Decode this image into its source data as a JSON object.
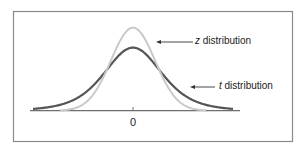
{
  "figure": {
    "frame_color": "#8a8a8a",
    "axis_color": "#6e6e6e",
    "x_tick_label": "0",
    "labels": {
      "z": {
        "var": "z",
        "text": " distribution"
      },
      "t": {
        "var": "t",
        "text": " distribution"
      }
    }
  },
  "chart_data": {
    "type": "line",
    "title": "",
    "xlabel": "",
    "ylabel": "",
    "x_ticks": [
      "0"
    ],
    "grid": false,
    "series": [
      {
        "name": "z distribution",
        "color": "#c9c9c9",
        "shape": "normal",
        "relative_peak": 1.0,
        "relative_spread": 1.0
      },
      {
        "name": "t distribution",
        "color": "#555555",
        "shape": "t (heavier tails)",
        "relative_peak": 0.76,
        "relative_spread": 1.35
      }
    ],
    "annotations": [
      "z distribution",
      "t distribution"
    ]
  }
}
